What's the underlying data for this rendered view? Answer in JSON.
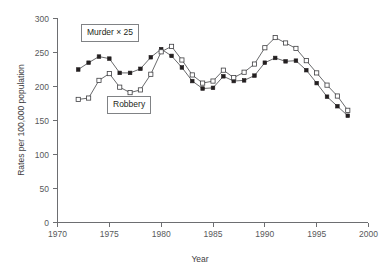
{
  "chart_data": {
    "type": "line",
    "title": "",
    "xlabel": "Year",
    "ylabel": "Rates per 100,000 population",
    "xlim": [
      1970,
      2000
    ],
    "ylim": [
      0,
      300
    ],
    "xticks": [
      1970,
      1975,
      1980,
      1985,
      1990,
      1995,
      2000
    ],
    "yticks": [
      0,
      50,
      100,
      150,
      200,
      250,
      300
    ],
    "grid": false,
    "legend_position": "inline-callout",
    "x": [
      1972,
      1973,
      1974,
      1975,
      1976,
      1977,
      1978,
      1979,
      1980,
      1981,
      1982,
      1983,
      1984,
      1985,
      1986,
      1987,
      1988,
      1989,
      1990,
      1991,
      1992,
      1993,
      1994,
      1995,
      1996,
      1997,
      1998
    ],
    "series": [
      {
        "name": "Murder × 25",
        "marker": "filled-square",
        "values": [
          225,
          235,
          244,
          241,
          220,
          220,
          226,
          243,
          255,
          245,
          228,
          208,
          197,
          198,
          215,
          208,
          209,
          216,
          235,
          242,
          237,
          238,
          224,
          205,
          185,
          171,
          157
        ]
      },
      {
        "name": "Robbery",
        "marker": "open-square",
        "values": [
          181,
          183,
          209,
          219,
          199,
          191,
          195,
          218,
          251,
          259,
          239,
          217,
          205,
          208,
          224,
          213,
          221,
          233,
          257,
          272,
          264,
          256,
          238,
          220,
          202,
          186,
          165
        ]
      }
    ],
    "annotations": [
      {
        "name": "murder-callout",
        "text": "Murder × 25"
      },
      {
        "name": "robbery-callout",
        "text": "Robbery"
      }
    ]
  },
  "axes": {
    "x_title": "Year",
    "y_title": "Rates per 100,000 population",
    "x_tick_labels": [
      "1970",
      "1975",
      "1980",
      "1985",
      "1990",
      "1995",
      "2000"
    ],
    "y_tick_labels": [
      "0",
      "50",
      "100",
      "150",
      "200",
      "250",
      "300"
    ]
  },
  "callouts": {
    "murder": "Murder × 25",
    "robbery": "Robbery"
  },
  "colors": {
    "axis": "#6d6e71",
    "text": "#231f20",
    "line": "#58595b",
    "marker_filled": "#231f20",
    "marker_open_fill": "#ffffff",
    "marker_open_stroke": "#3f3f42",
    "background": "#ffffff"
  }
}
